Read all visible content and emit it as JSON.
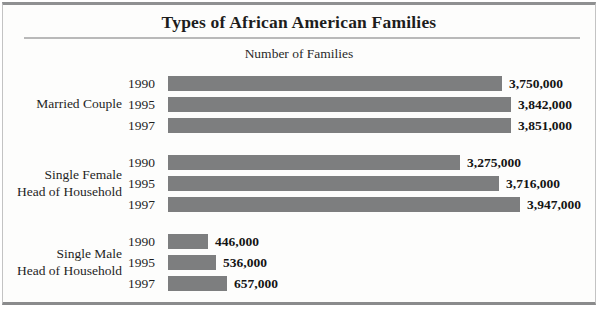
{
  "figure": {
    "title": "Types of African American Families",
    "subtitle": "Number of Families"
  },
  "colors": {
    "bar_fill": "#7d7e7f",
    "text": "#1d1d1d",
    "border": "#8f9091",
    "rule": "#b9b9b9",
    "background": "#fdfdfc"
  },
  "chart_data": {
    "type": "bar",
    "orientation": "horizontal",
    "title": "Types of African American Families",
    "xlabel": "Number of Families",
    "categories": [
      "1990",
      "1995",
      "1997"
    ],
    "grid": false,
    "legend": false,
    "x_max": 3947000,
    "groups": [
      {
        "label": "Married Couple",
        "label_lines": [
          "Married Couple"
        ],
        "years": [
          "1990",
          "1995",
          "1997"
        ],
        "values": [
          3750000,
          3842000,
          3851000
        ],
        "value_labels": [
          "3,750,000",
          "3,842,000",
          "3,851,000"
        ]
      },
      {
        "label": "Single Female Head of Household",
        "label_lines": [
          "Single Female",
          "Head of Household"
        ],
        "years": [
          "1990",
          "1995",
          "1997"
        ],
        "values": [
          3275000,
          3716000,
          3947000
        ],
        "value_labels": [
          "3,275,000",
          "3,716,000",
          "3,947,000"
        ]
      },
      {
        "label": "Single Male Head of Household",
        "label_lines": [
          "Single Male",
          "Head of Household"
        ],
        "years": [
          "1990",
          "1995",
          "1997"
        ],
        "values": [
          446000,
          536000,
          657000
        ],
        "value_labels": [
          "446,000",
          "536,000",
          "657,000"
        ]
      }
    ]
  }
}
